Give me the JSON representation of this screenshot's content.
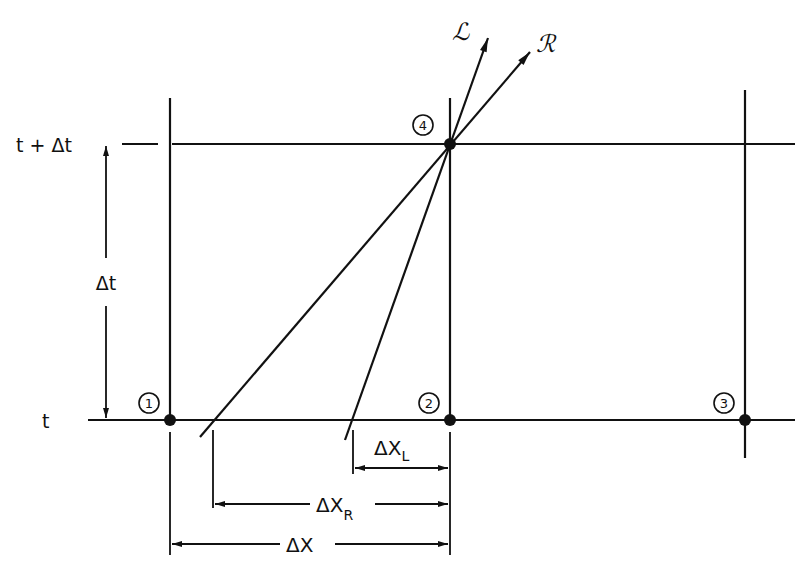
{
  "diagram": {
    "type": "characteristic-grid",
    "colors": {
      "ink": "#111111",
      "background": "#ffffff"
    },
    "time_labels": {
      "top": "t + Δt",
      "bottom": "t",
      "interval": "Δt"
    },
    "nodes": [
      {
        "id": "1",
        "label": "1"
      },
      {
        "id": "2",
        "label": "2"
      },
      {
        "id": "3",
        "label": "3"
      },
      {
        "id": "4",
        "label": "4"
      }
    ],
    "characteristics": {
      "left": "ℒ",
      "right": "ℛ"
    },
    "dimensions": {
      "dx_left": "ΔX",
      "dx_left_sub": "L",
      "dx_right": "ΔX",
      "dx_right_sub": "R",
      "dx": "ΔX"
    }
  }
}
